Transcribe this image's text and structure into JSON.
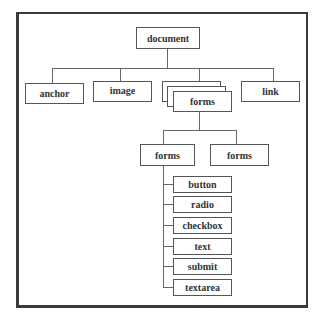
{
  "diagram": {
    "type": "tree",
    "root": "document",
    "level1": [
      "anchor",
      "image",
      "forms",
      "link"
    ],
    "forms_stack_note": "forms shown as stacked multiple boxes",
    "level2": [
      "forms",
      "forms"
    ],
    "level3": [
      "button",
      "radio",
      "checkbox",
      "text",
      "submit",
      "textarea"
    ],
    "edges": [
      [
        "document",
        "anchor"
      ],
      [
        "document",
        "image"
      ],
      [
        "document",
        "forms"
      ],
      [
        "document",
        "link"
      ],
      [
        "forms",
        "forms (1)"
      ],
      [
        "forms",
        "forms (2)"
      ],
      [
        "forms (1)",
        "button"
      ],
      [
        "forms (1)",
        "radio"
      ],
      [
        "forms (1)",
        "checkbox"
      ],
      [
        "forms (1)",
        "text"
      ],
      [
        "forms (1)",
        "submit"
      ],
      [
        "forms (1)",
        "textarea"
      ]
    ]
  },
  "labels": {
    "document": "document",
    "anchor": "anchor",
    "image": "image",
    "forms": "forms",
    "link": "link",
    "forms_a": "forms",
    "forms_b": "forms",
    "button": "button",
    "radio": "radio",
    "checkbox": "checkbox",
    "text": "text",
    "submit": "submit",
    "textarea": "textarea"
  }
}
